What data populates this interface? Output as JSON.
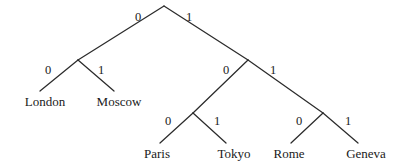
{
  "diagram": {
    "type": "binary-code-tree",
    "background_color": "#ffffff",
    "line_color": "#2b2b2b",
    "text_color": "#1a1a1a",
    "nodes": [
      {
        "id": "root",
        "x": 164,
        "y": 6,
        "kind": "internal"
      },
      {
        "id": "n0",
        "x": 78,
        "y": 60,
        "kind": "internal"
      },
      {
        "id": "n1",
        "x": 248,
        "y": 60,
        "kind": "internal"
      },
      {
        "id": "n10",
        "x": 193,
        "y": 113,
        "kind": "internal"
      },
      {
        "id": "n11",
        "x": 323,
        "y": 113,
        "kind": "internal"
      }
    ],
    "edges": [
      {
        "id": "edge-root-left",
        "from": "root",
        "to": "n0",
        "x1": 164,
        "y1": 6,
        "x2": 78,
        "y2": 60,
        "label": "0",
        "label_x": 138,
        "label_y": 17
      },
      {
        "id": "edge-root-right",
        "from": "root",
        "to": "n1",
        "x1": 164,
        "y1": 6,
        "x2": 248,
        "y2": 60,
        "label": "1",
        "label_x": 189,
        "label_y": 17
      },
      {
        "id": "edge-n0-left",
        "from": "n0",
        "to": "london",
        "x1": 78,
        "y1": 60,
        "x2": 40,
        "y2": 91,
        "label": "0",
        "label_x": 48,
        "label_y": 70
      },
      {
        "id": "edge-n0-right",
        "from": "n0",
        "to": "moscow",
        "x1": 78,
        "y1": 60,
        "x2": 114,
        "y2": 91,
        "label": "1",
        "label_x": 101,
        "label_y": 70
      },
      {
        "id": "edge-n1-left",
        "from": "n1",
        "to": "n10",
        "x1": 248,
        "y1": 60,
        "x2": 193,
        "y2": 113,
        "label": "0",
        "label_x": 226,
        "label_y": 70
      },
      {
        "id": "edge-n1-right",
        "from": "n1",
        "to": "n11",
        "x1": 248,
        "y1": 60,
        "x2": 323,
        "y2": 113,
        "label": "1",
        "label_x": 273,
        "label_y": 70
      },
      {
        "id": "edge-n10-left",
        "from": "n10",
        "to": "paris",
        "x1": 193,
        "y1": 113,
        "x2": 160,
        "y2": 143,
        "label": "0",
        "label_x": 168,
        "label_y": 121
      },
      {
        "id": "edge-n10-right",
        "from": "n10",
        "to": "tokyo",
        "x1": 193,
        "y1": 113,
        "x2": 226,
        "y2": 143,
        "label": "1",
        "label_x": 217,
        "label_y": 121
      },
      {
        "id": "edge-n11-left",
        "from": "n11",
        "to": "rome",
        "x1": 323,
        "y1": 113,
        "x2": 291,
        "y2": 143,
        "label": "0",
        "label_x": 299,
        "label_y": 121
      },
      {
        "id": "edge-n11-right",
        "from": "n11",
        "to": "geneva",
        "x1": 323,
        "y1": 113,
        "x2": 358,
        "y2": 143,
        "label": "1",
        "label_x": 348,
        "label_y": 121
      }
    ],
    "leaves": [
      {
        "id": "london",
        "label": "London",
        "code": "00",
        "x": 45,
        "y": 95
      },
      {
        "id": "moscow",
        "label": "Moscow",
        "code": "01",
        "x": 119,
        "y": 95
      },
      {
        "id": "paris",
        "label": "Paris",
        "code": "100",
        "x": 157,
        "y": 147
      },
      {
        "id": "tokyo",
        "label": "Tokyo",
        "code": "101",
        "x": 234,
        "y": 147
      },
      {
        "id": "rome",
        "label": "Rome",
        "code": "110",
        "x": 289,
        "y": 147
      },
      {
        "id": "geneva",
        "label": "Geneva",
        "code": "111",
        "x": 366,
        "y": 147
      }
    ]
  }
}
